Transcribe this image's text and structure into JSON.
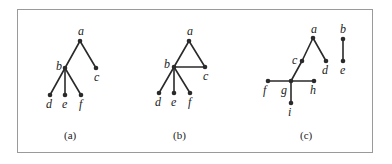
{
  "figure": {
    "panels": [
      {
        "caption": "(a)",
        "nodes": [
          {
            "id": "a",
            "label": "a",
            "x": 80,
            "y": 41,
            "lx": 78,
            "ly": 35
          },
          {
            "id": "b",
            "label": "b",
            "x": 65,
            "y": 68,
            "lx": 56,
            "ly": 70
          },
          {
            "id": "c",
            "label": "c",
            "x": 96,
            "y": 68,
            "lx": 94,
            "ly": 81
          },
          {
            "id": "d",
            "label": "d",
            "x": 50,
            "y": 95,
            "lx": 46,
            "ly": 108
          },
          {
            "id": "e",
            "label": "e",
            "x": 65,
            "y": 95,
            "lx": 62,
            "ly": 108
          },
          {
            "id": "f",
            "label": "f",
            "x": 81,
            "y": 95,
            "lx": 79,
            "ly": 108
          }
        ],
        "edges": [
          [
            "a",
            "b"
          ],
          [
            "a",
            "c"
          ],
          [
            "b",
            "d"
          ],
          [
            "b",
            "e"
          ],
          [
            "b",
            "f"
          ]
        ]
      },
      {
        "caption": "(b)",
        "nodes": [
          {
            "id": "a",
            "label": "a",
            "x": 189,
            "y": 41,
            "lx": 187,
            "ly": 35
          },
          {
            "id": "b",
            "label": "b",
            "x": 174,
            "y": 67,
            "lx": 164,
            "ly": 68
          },
          {
            "id": "c",
            "label": "c",
            "x": 205,
            "y": 67,
            "lx": 203,
            "ly": 80
          },
          {
            "id": "d",
            "label": "d",
            "x": 159,
            "y": 93,
            "lx": 155,
            "ly": 106
          },
          {
            "id": "e",
            "label": "e",
            "x": 174,
            "y": 93,
            "lx": 171,
            "ly": 106
          },
          {
            "id": "f",
            "label": "f",
            "x": 190,
            "y": 93,
            "lx": 188,
            "ly": 106
          }
        ],
        "edges": [
          [
            "a",
            "b"
          ],
          [
            "a",
            "c"
          ],
          [
            "b",
            "c"
          ],
          [
            "b",
            "d"
          ],
          [
            "b",
            "e"
          ],
          [
            "b",
            "f"
          ]
        ]
      },
      {
        "caption": "(c)",
        "nodes": [
          {
            "id": "a",
            "label": "a",
            "x": 313,
            "y": 38,
            "lx": 311,
            "ly": 33
          },
          {
            "id": "b",
            "label": "b",
            "x": 343,
            "y": 39,
            "lx": 340,
            "ly": 33
          },
          {
            "id": "c",
            "label": "c",
            "x": 302,
            "y": 61,
            "lx": 292,
            "ly": 64
          },
          {
            "id": "d",
            "label": "d",
            "x": 326,
            "y": 61,
            "lx": 322,
            "ly": 74
          },
          {
            "id": "e",
            "label": "e",
            "x": 343,
            "y": 61,
            "lx": 340,
            "ly": 74
          },
          {
            "id": "f",
            "label": "f",
            "x": 268,
            "y": 81,
            "lx": 263,
            "ly": 94
          },
          {
            "id": "g",
            "label": "g",
            "x": 291,
            "y": 81,
            "lx": 281,
            "ly": 94
          },
          {
            "id": "h",
            "label": "h",
            "x": 314,
            "y": 81,
            "lx": 310,
            "ly": 94
          },
          {
            "id": "i",
            "label": "i",
            "x": 291,
            "y": 103,
            "lx": 288,
            "ly": 116
          }
        ],
        "edges": [
          [
            "a",
            "c"
          ],
          [
            "c",
            "g"
          ],
          [
            "a",
            "d"
          ],
          [
            "b",
            "e"
          ],
          [
            "f",
            "g"
          ],
          [
            "g",
            "h"
          ],
          [
            "g",
            "i"
          ]
        ]
      }
    ]
  }
}
